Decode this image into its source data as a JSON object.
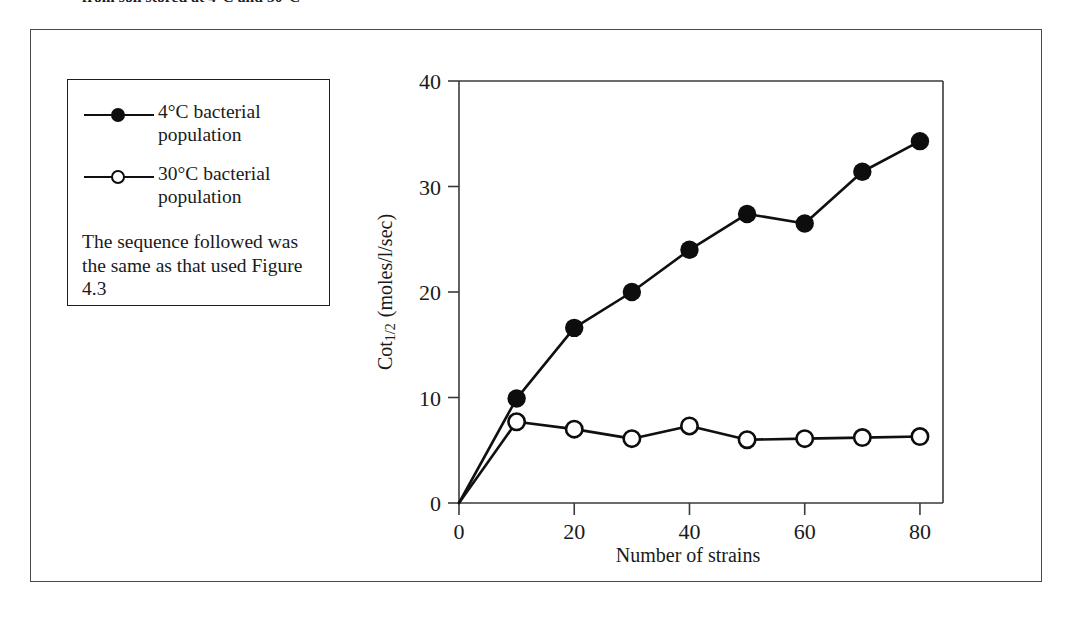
{
  "caption": {
    "clipped_line": "from soil stored at 4°C and 30°C"
  },
  "legend": {
    "entries": [
      {
        "marker": "filled-circle-marker",
        "label": "4°C bacterial population"
      },
      {
        "marker": "open-circle-marker",
        "label": "30°C bacterial population"
      }
    ],
    "note": "The sequence followed was the same as that used Figure 4.3"
  },
  "chart_data": {
    "type": "line",
    "title": "",
    "xlabel": "Number of strains",
    "ylabel": "Cot1/2 (moles/l/sec)",
    "ylabel_parts": {
      "base": "Cot",
      "subscript_num": "1",
      "subscript_den": "2",
      "units": "(moles/l/sec)"
    },
    "x": [
      0,
      10,
      20,
      30,
      40,
      50,
      60,
      70,
      80
    ],
    "xlim": [
      0,
      84
    ],
    "ylim": [
      0,
      40
    ],
    "xticks": [
      0,
      20,
      40,
      60,
      80
    ],
    "yticks": [
      0,
      10,
      20,
      30,
      40
    ],
    "grid": false,
    "legend_position": "outside-left",
    "series": [
      {
        "name": "4°C bacterial population",
        "marker": "filled-circle",
        "color": "#0d0d0d",
        "values": [
          0,
          9.9,
          16.6,
          20.0,
          24.0,
          27.4,
          26.5,
          31.4,
          34.3
        ]
      },
      {
        "name": "30°C bacterial population",
        "marker": "open-circle",
        "color": "#0d0d0d",
        "values": [
          0,
          7.7,
          7.0,
          6.1,
          7.3,
          6.0,
          6.1,
          6.2,
          6.3
        ]
      }
    ]
  }
}
